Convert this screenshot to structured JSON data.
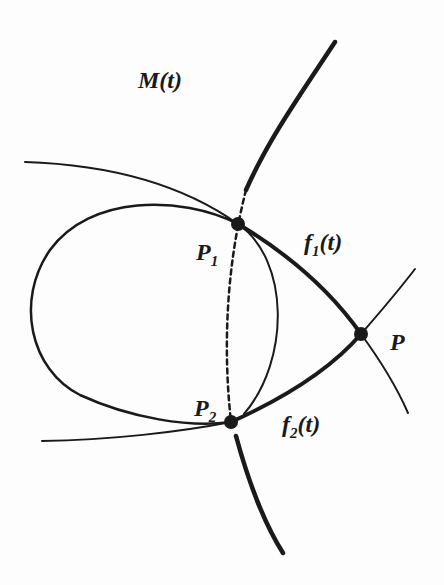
{
  "diagram": {
    "labels": {
      "M": "M(t)",
      "P1_base": "P",
      "P1_sub": "1",
      "P2_base": "P",
      "P2_sub": "2",
      "P": "P",
      "f1_base": "f",
      "f1_sub": "1",
      "f1_arg": "(t)",
      "f2_base": "f",
      "f2_sub": "2",
      "f2_arg": "(t)"
    },
    "points": {
      "P1": [
        238,
        224
      ],
      "P2": [
        231,
        422
      ],
      "P": [
        361,
        334
      ]
    },
    "colors": {
      "ink": "#1a1a1a",
      "background": "#fdfdfd"
    }
  }
}
